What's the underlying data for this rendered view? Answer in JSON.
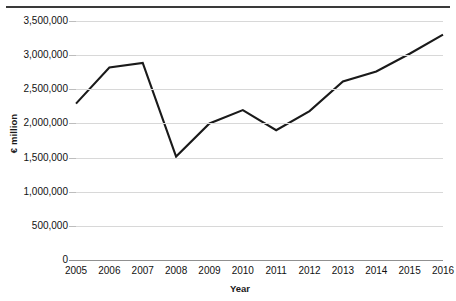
{
  "chart_data": {
    "type": "line",
    "title": "",
    "xlabel": "Year",
    "ylabel": "€ million",
    "categories": [
      "2005",
      "2006",
      "2007",
      "2008",
      "2009",
      "2010",
      "2011",
      "2012",
      "2013",
      "2014",
      "2015",
      "2016"
    ],
    "x": [
      2005,
      2006,
      2007,
      2008,
      2009,
      2010,
      2011,
      2012,
      2013,
      2014,
      2015,
      2016
    ],
    "values": [
      2290000,
      2820000,
      2885000,
      1515000,
      2000000,
      2195000,
      1900000,
      2180000,
      2615000,
      2760000,
      3020000,
      3300000
    ],
    "series": [
      {
        "name": "€ million",
        "values": [
          2290000,
          2820000,
          2885000,
          1515000,
          2000000,
          2195000,
          1900000,
          2180000,
          2615000,
          2760000,
          3020000,
          3300000
        ]
      }
    ],
    "ylim": [
      0,
      3500000
    ],
    "ytick_values": [
      0,
      500000,
      1000000,
      1500000,
      2000000,
      2500000,
      3000000,
      3500000
    ],
    "ytick_labels": [
      "0",
      "500,000",
      "1,000,000",
      "1,500,000",
      "2,000,000",
      "2,500,000",
      "3,000,000",
      "3,500,000"
    ],
    "grid": true,
    "legend": false,
    "legend_position": "none",
    "line_color": "#1a1a1a",
    "gridline_color": "#d8d8d8",
    "axis_color": "#909090",
    "background_color": "#ffffff"
  },
  "axes": {
    "y_title": "€ million",
    "x_title": "Year"
  }
}
